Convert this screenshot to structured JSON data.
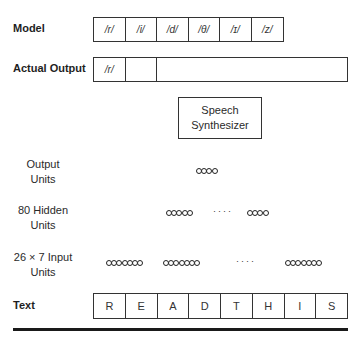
{
  "rows": {
    "model": {
      "label": "Model",
      "phonemes": [
        "/r/",
        "/i/",
        "/d/",
        "/θ/",
        "/ɪ/",
        "/z/"
      ]
    },
    "actual_output": {
      "label": "Actual Output",
      "phonemes": [
        "/r/",
        "",
        ""
      ]
    },
    "synthesizer": {
      "line1": "Speech",
      "line2": "Synthesizer"
    },
    "output_units": {
      "label_line1": "Output",
      "label_line2": "Units",
      "groups": [
        4
      ]
    },
    "hidden_units": {
      "label_line1": "80 Hidden",
      "label_line2": "Units",
      "groups": [
        5,
        4
      ],
      "ellipsis": "····"
    },
    "input_units": {
      "label_line1": "26 × 7 Input",
      "label_line2": "Units",
      "groups": [
        7,
        7,
        7
      ],
      "ellipsis": "····"
    },
    "text": {
      "label": "Text",
      "letters": [
        "R",
        "E",
        "A",
        "D",
        "T",
        "H",
        "I",
        "S"
      ]
    }
  },
  "colors": {
    "stroke": "#333333",
    "text": "#222222",
    "background": "#ffffff"
  }
}
